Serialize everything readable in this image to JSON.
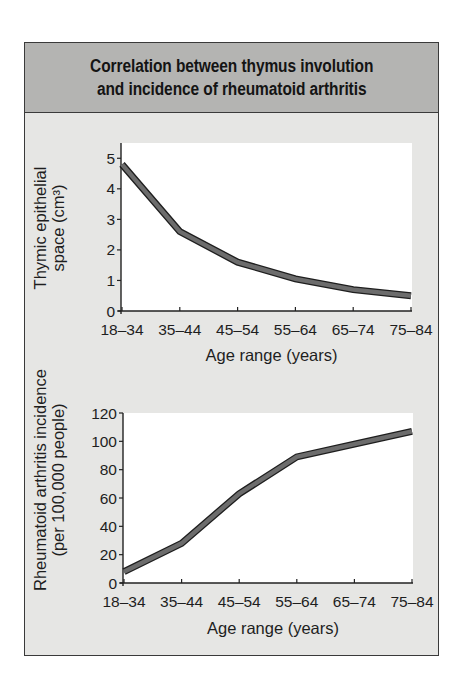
{
  "figure": {
    "title_lines": [
      "Correlation between thymus involution",
      "and incidence of rheumatoid arthritis"
    ],
    "colors": {
      "header_bg": "#b4b4b2",
      "body_bg": "#e6e6e4",
      "plot_bg": "#ffffff",
      "line_fill": "#6c6c6c",
      "line_outline": "#1e1e1e",
      "border": "#3a3a3a"
    }
  },
  "chart_data": [
    {
      "type": "line",
      "title": "Thymic epithelial space vs age",
      "categories": [
        "18–34",
        "35–44",
        "45–54",
        "55–64",
        "65–74",
        "75–84"
      ],
      "series": [
        {
          "name": "Thymic epithelial space",
          "values": [
            4.8,
            2.6,
            1.6,
            1.05,
            0.7,
            0.5
          ]
        }
      ],
      "xlabel": "Age range (years)",
      "ylabel_lines": [
        "Thymic epithelial",
        "space (cm³)"
      ],
      "yticks": [
        0,
        1,
        2,
        3,
        4,
        5
      ],
      "ylim": [
        0,
        5.5
      ],
      "grid": false,
      "legend": "none"
    },
    {
      "type": "line",
      "title": "Rheumatoid arthritis incidence vs age",
      "categories": [
        "18–34",
        "35–44",
        "45–54",
        "55–64",
        "65–74",
        "75–84"
      ],
      "series": [
        {
          "name": "Rheumatoid arthritis incidence",
          "values": [
            8,
            28,
            63,
            89,
            98,
            107
          ]
        }
      ],
      "xlabel": "Age range (years)",
      "ylabel_lines": [
        "Rheumatoid arthritis incidence",
        "(per 100,000 people)"
      ],
      "yticks": [
        0,
        20,
        40,
        60,
        80,
        100,
        120
      ],
      "ylim": [
        0,
        120
      ],
      "grid": false,
      "legend": "none"
    }
  ]
}
